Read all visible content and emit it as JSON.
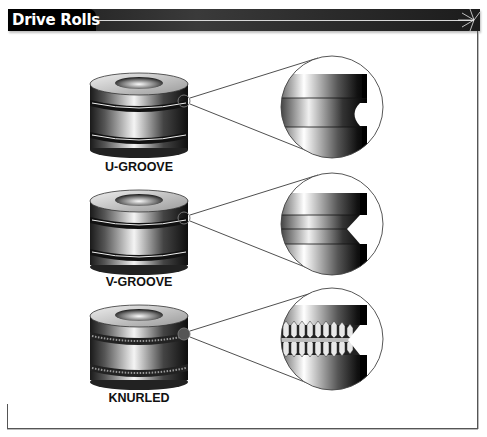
{
  "header": {
    "title": "Drive Rolls"
  },
  "rolls": [
    {
      "label": "U-GROOVE",
      "groove_type": "u-groove"
    },
    {
      "label": "V-GROOVE",
      "groove_type": "v-groove"
    },
    {
      "label": "KNURLED",
      "groove_type": "knurled"
    }
  ],
  "colors": {
    "header_bg": "#000000",
    "header_text": "#ffffff",
    "frame": "#555555",
    "background": "#ffffff"
  }
}
